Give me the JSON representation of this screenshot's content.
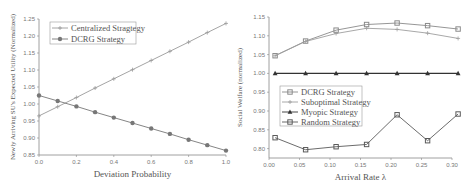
{
  "chart_data": [
    {
      "type": "line",
      "title": "",
      "xlabel": "Deviation Probability",
      "ylabel": "Newly Arriving SU's Expected Utility (Normalized)",
      "xlim": [
        0.0,
        1.0
      ],
      "ylim": [
        0.85,
        1.25
      ],
      "x_ticks": [
        "0.0",
        "0.2",
        "0.4",
        "0.6",
        "0.8",
        "1.0"
      ],
      "y_ticks": [
        "0.85",
        "0.90",
        "0.95",
        "1.00",
        "1.05",
        "1.10",
        "1.15",
        "1.20",
        "1.25"
      ],
      "grid": false,
      "legend_position": "upper left",
      "x": [
        0.0,
        0.1,
        0.2,
        0.3,
        0.4,
        0.5,
        0.6,
        0.7,
        0.8,
        0.9,
        1.0
      ],
      "series": [
        {
          "name": "Centralized Stragtegy",
          "color": "#9a9a9a",
          "marker": "plus",
          "values": [
            0.965,
            0.992,
            1.019,
            1.047,
            1.074,
            1.101,
            1.128,
            1.155,
            1.182,
            1.21,
            1.237
          ]
        },
        {
          "name": "DCRG Strategy",
          "color": "#777777",
          "marker": "circle",
          "values": [
            1.025,
            1.009,
            0.993,
            0.976,
            0.96,
            0.944,
            0.928,
            0.912,
            0.895,
            0.879,
            0.863
          ]
        }
      ]
    },
    {
      "type": "line",
      "title": "",
      "xlabel": "Arrival Rate λ",
      "ylabel": "Social Welfare (normalized)",
      "xlim": [
        0.0,
        0.31
      ],
      "ylim": [
        0.775,
        1.155
      ],
      "x_ticks": [
        "0.00",
        "0.05",
        "0.10",
        "0.15",
        "0.20",
        "0.25",
        "0.30"
      ],
      "y_ticks": [
        "0.80",
        "0.85",
        "0.90",
        "0.95",
        "1.00",
        "1.05",
        "1.10",
        "1.15"
      ],
      "grid": false,
      "legend_position": "center left",
      "x": [
        0.01,
        0.06,
        0.11,
        0.16,
        0.21,
        0.26,
        0.31
      ],
      "series": [
        {
          "name": "DCRG Strategy",
          "color": "#8a8a8a",
          "marker": "square",
          "values": [
            1.047,
            1.086,
            1.115,
            1.13,
            1.134,
            1.127,
            1.118
          ]
        },
        {
          "name": "Suboptimal Strategy",
          "color": "#9e9e9e",
          "marker": "plus",
          "values": [
            1.047,
            1.085,
            1.106,
            1.12,
            1.117,
            1.107,
            1.093
          ]
        },
        {
          "name": "Myopic Strategy",
          "color": "#333333",
          "marker": "triangle",
          "values": [
            1.0,
            1.0,
            1.0,
            1.0,
            1.0,
            1.0,
            1.0
          ]
        },
        {
          "name": "Random Strategy",
          "color": "#5a5a5a",
          "marker": "square",
          "values": [
            0.829,
            0.797,
            0.805,
            0.811,
            0.89,
            0.821,
            0.892
          ]
        }
      ]
    }
  ]
}
